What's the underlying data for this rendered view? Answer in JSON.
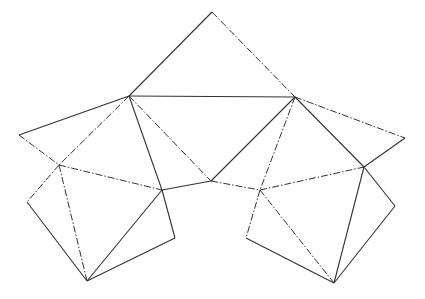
{
  "diagram": {
    "type": "polyhedron-net",
    "stroke_color": "#333333",
    "background": "#ffffff",
    "vertices": {
      "T": [
        212,
        12
      ],
      "A": [
        129,
        96
      ],
      "B": [
        295,
        97
      ],
      "L": [
        19,
        135
      ],
      "R": [
        405,
        138
      ],
      "C": [
        59,
        165
      ],
      "D": [
        162,
        190
      ],
      "M": [
        211,
        181
      ],
      "E": [
        260,
        190
      ],
      "F": [
        364,
        167
      ],
      "P1": [
        27,
        202
      ],
      "BL": [
        87,
        281
      ],
      "Q1": [
        175,
        238
      ],
      "P2": [
        246,
        238
      ],
      "BR": [
        334,
        283
      ],
      "Q2": [
        395,
        206
      ]
    },
    "edges": [
      {
        "from": "T",
        "to": "A",
        "style": "solid"
      },
      {
        "from": "T",
        "to": "B",
        "style": "dashdot"
      },
      {
        "from": "A",
        "to": "B",
        "style": "solid"
      },
      {
        "from": "A",
        "to": "L",
        "style": "solid"
      },
      {
        "from": "L",
        "to": "C",
        "style": "dashdot"
      },
      {
        "from": "A",
        "to": "C",
        "style": "dashdot"
      },
      {
        "from": "A",
        "to": "D",
        "style": "solid"
      },
      {
        "from": "A",
        "to": "M",
        "style": "dashdot"
      },
      {
        "from": "M",
        "to": "B",
        "style": "solid"
      },
      {
        "from": "D",
        "to": "M",
        "style": "solid"
      },
      {
        "from": "M",
        "to": "E",
        "style": "dashdot"
      },
      {
        "from": "B",
        "to": "E",
        "style": "dashdot"
      },
      {
        "from": "B",
        "to": "F",
        "style": "solid"
      },
      {
        "from": "B",
        "to": "R",
        "style": "dashdot"
      },
      {
        "from": "R",
        "to": "F",
        "style": "solid"
      },
      {
        "from": "C",
        "to": "D",
        "style": "dashdot"
      },
      {
        "from": "E",
        "to": "F",
        "style": "dashdot"
      },
      {
        "from": "C",
        "to": "P1",
        "style": "dashdot"
      },
      {
        "from": "P1",
        "to": "BL",
        "style": "solid"
      },
      {
        "from": "C",
        "to": "BL",
        "style": "dashdot"
      },
      {
        "from": "D",
        "to": "BL",
        "style": "solid"
      },
      {
        "from": "D",
        "to": "Q1",
        "style": "solid"
      },
      {
        "from": "Q1",
        "to": "BL",
        "style": "solid"
      },
      {
        "from": "E",
        "to": "P2",
        "style": "dashdot"
      },
      {
        "from": "P2",
        "to": "BR",
        "style": "solid"
      },
      {
        "from": "E",
        "to": "BR",
        "style": "dashdot"
      },
      {
        "from": "F",
        "to": "BR",
        "style": "solid"
      },
      {
        "from": "F",
        "to": "Q2",
        "style": "solid"
      },
      {
        "from": "Q2",
        "to": "BR",
        "style": "solid"
      }
    ]
  }
}
